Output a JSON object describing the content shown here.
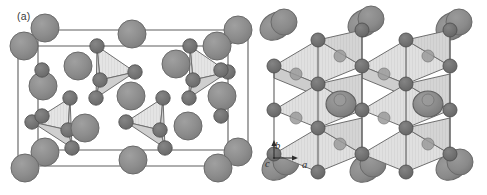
{
  "figure": {
    "background_color": "#ffffff",
    "width": 487,
    "height": 195,
    "type": "crystal-structure-diagram"
  },
  "panels": [
    {
      "id": "a",
      "label": "(a)",
      "description": "Unit cell of crystal structure viewed in perspective, showing large cation spheres at cell corners and edges with isolated shaded tetrahedral anion groups inside the cell",
      "polyhedra_type": "tetrahedra",
      "polyhedra_count": 4,
      "unit_cell_outline": true
    },
    {
      "id": "b",
      "label": "(b)",
      "description": "Corner-sharing octahedral framework viewed down the c axis, with large cations occupying cavities between the polyhedra",
      "polyhedra_type": "octahedra",
      "unit_cell_outline": false,
      "axes": {
        "vertical": "b",
        "horizontal": "a",
        "into_page": "c"
      }
    }
  ],
  "axis_triad": {
    "b_label": "b",
    "a_label": "a",
    "c_label": "c"
  },
  "colors": {
    "large_sphere_fill": "#8d8d8d",
    "large_sphere_stroke": "#6a6a6a",
    "small_sphere_fill": "#747474",
    "small_sphere_stroke": "#545454",
    "polyhedron_face_light": "#e2e2e2",
    "polyhedron_face_mid": "#d2d2d2",
    "polyhedron_face_dark": "#c2c2c2",
    "polyhedron_edge": "#6f6f6f",
    "cell_edge": "#5e5e5e",
    "text": "#3a3a3a",
    "background": "#ffffff"
  }
}
